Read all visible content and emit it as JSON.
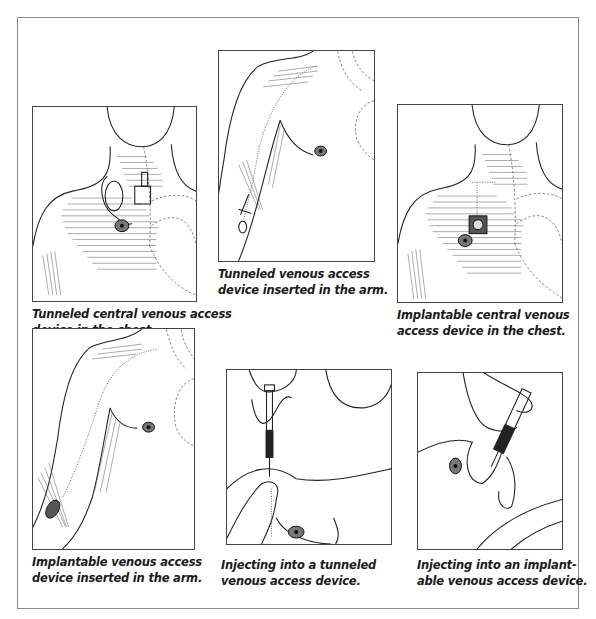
{
  "figure": {
    "panels": [
      {
        "id": "tunneled-central-chest",
        "illustration": "torso-chest-tunneled-catheter",
        "caption_lines": [
          "Tunneled central venous access",
          "device in the chest."
        ]
      },
      {
        "id": "tunneled-arm",
        "illustration": "arm-tunneled-catheter",
        "caption_lines": [
          "Tunneled venous access",
          "device inserted in the arm."
        ]
      },
      {
        "id": "implantable-central-chest",
        "illustration": "torso-chest-implanted-port",
        "caption_lines": [
          "Implantable central venous",
          "access device in the chest."
        ]
      },
      {
        "id": "implantable-arm",
        "illustration": "arm-implanted-port",
        "caption_lines": [
          "Implantable venous access",
          "device inserted in the arm."
        ]
      },
      {
        "id": "injecting-tunneled",
        "illustration": "hands-syringe-tunneled",
        "caption_lines": [
          "Injecting into a tunneled",
          "venous access device."
        ]
      },
      {
        "id": "injecting-implantable",
        "illustration": "hands-syringe-implantable",
        "caption_lines": [
          "Injecting into an implant-",
          "able venous access device."
        ]
      }
    ]
  },
  "colors": {
    "frame_border": "#8a8a8a",
    "line_art": "#222222",
    "caption_text": "#1a1a1a",
    "background": "#ffffff"
  }
}
